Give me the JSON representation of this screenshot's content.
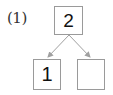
{
  "problem": {
    "label": "(1)",
    "whole": "2",
    "parts": [
      "1",
      ""
    ]
  },
  "colors": {
    "box_border": "#9a9a9a",
    "arrow": "#a0a0a0",
    "text": "#111111"
  }
}
